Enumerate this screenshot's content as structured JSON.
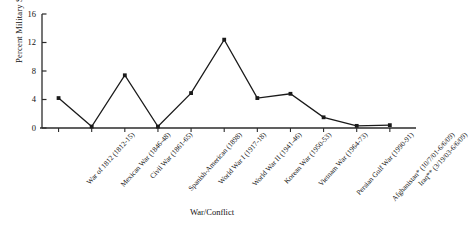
{
  "chart_data": {
    "type": "line",
    "title": "",
    "xlabel": "War/Conflict",
    "ylabel": "Percent Military Service",
    "ylim": [
      0,
      16
    ],
    "yticks": [
      0,
      4,
      8,
      12,
      16
    ],
    "ytick_labels": [
      "0",
      "4",
      "8",
      "12",
      "16"
    ],
    "grid": false,
    "legend": "none",
    "marker": "filled-square",
    "line_color": "#1a1a1a",
    "categories": [
      "War of 1812 (1812-15)",
      "Mexican War (1846-48)",
      "Civil War (1861-65)",
      "Spanish-American (1898)",
      "World War I (1917-18)",
      "World War II (1941-46)",
      "Korean War (1950-53)",
      "Vietnam War (1964-73)",
      "Persian Gulf War (1990-91)",
      "Afghanistan* (10/7/01-6/6/09)",
      "Iraq** (3/19/03-6/6/09)"
    ],
    "values": [
      4.2,
      0.2,
      7.4,
      0.2,
      4.9,
      12.4,
      4.2,
      4.8,
      1.5,
      0.3,
      0.4
    ]
  },
  "axis": {
    "x_title": "War/Conflict",
    "y_title": "Percent Military Service"
  }
}
